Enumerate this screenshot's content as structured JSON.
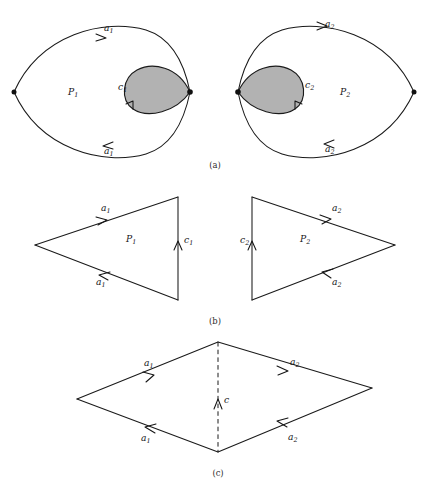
{
  "figure": {
    "type": "mathematical-diagram",
    "background_color": "#ffffff",
    "ink_color": "#1a1a1a",
    "shaded_region_fill": "#b2b2b2",
    "panels": [
      {
        "id": "a",
        "caption": "(a)",
        "caption_x": 215,
        "caption_y": 168,
        "items": [
          {
            "name": "left-lens",
            "region_label": "P",
            "region_sub": "1",
            "region_label_x": 68,
            "region_label_y": 95,
            "edge_top_label": "a",
            "edge_top_sub": "1",
            "edge_top_label_x": 104,
            "edge_top_label_y": 31,
            "edge_bottom_label": "a",
            "edge_bottom_sub": "1",
            "edge_bottom_label_x": 104,
            "edge_bottom_label_y": 154,
            "blob_label": "c",
            "blob_sub": "1",
            "blob_label_x": 118,
            "blob_label_y": 90
          },
          {
            "name": "right-lens",
            "region_label": "P",
            "region_sub": "2",
            "region_label_x": 340,
            "region_label_y": 95,
            "edge_top_label": "a",
            "edge_top_sub": "2",
            "edge_top_label_x": 325,
            "edge_top_label_y": 27,
            "edge_bottom_label": "a",
            "edge_bottom_sub": "2",
            "edge_bottom_label_x": 325,
            "edge_bottom_label_y": 152,
            "blob_label": "c",
            "blob_sub": "2",
            "blob_label_x": 305,
            "blob_label_y": 88
          }
        ]
      },
      {
        "id": "b",
        "caption": "(b)",
        "caption_x": 215,
        "caption_y": 324,
        "items": [
          {
            "name": "left-triangle",
            "region_label": "P",
            "region_sub": "1",
            "region_label_x": 126,
            "region_label_y": 242,
            "edge_top_label": "a",
            "edge_top_sub": "1",
            "edge_top_label_x": 101,
            "edge_top_label_y": 211,
            "edge_bottom_label": "a",
            "edge_bottom_sub": "1",
            "edge_bottom_label_x": 96,
            "edge_bottom_label_y": 285,
            "edge_right_label": "c",
            "edge_right_sub": "1",
            "edge_right_label_x": 184,
            "edge_right_label_y": 243
          },
          {
            "name": "right-triangle",
            "region_label": "P",
            "region_sub": "2",
            "region_label_x": 300,
            "region_label_y": 242,
            "edge_top_label": "a",
            "edge_top_sub": "2",
            "edge_top_label_x": 332,
            "edge_top_label_y": 211,
            "edge_bottom_label": "a",
            "edge_bottom_sub": "2",
            "edge_bottom_label_x": 332,
            "edge_bottom_label_y": 285,
            "edge_left_label": "c",
            "edge_left_sub": "2",
            "edge_left_label_x": 243,
            "edge_left_label_y": 243
          }
        ]
      },
      {
        "id": "c",
        "caption": "(c)",
        "caption_x": 218,
        "caption_y": 474,
        "items": [
          {
            "name": "rhombus",
            "edge_upper_left_label": "a",
            "edge_upper_left_sub": "1",
            "edge_upper_left_label_x": 144,
            "edge_upper_left_label_y": 366,
            "edge_lower_left_label": "a",
            "edge_lower_left_sub": "1",
            "edge_lower_left_label_x": 144,
            "edge_lower_left_label_y": 439,
            "edge_upper_right_label": "a",
            "edge_upper_right_sub": "2",
            "edge_upper_right_label_x": 293,
            "edge_upper_right_label_y": 366,
            "edge_lower_right_label": "a",
            "edge_lower_right_sub": "2",
            "edge_lower_right_label_x": 293,
            "edge_lower_right_label_y": 439,
            "diagonal_label": "c",
            "diagonal_sub": "",
            "diagonal_label_x": 225,
            "diagonal_label_y": 402,
            "diagonal_style": "dashed"
          }
        ]
      }
    ]
  }
}
